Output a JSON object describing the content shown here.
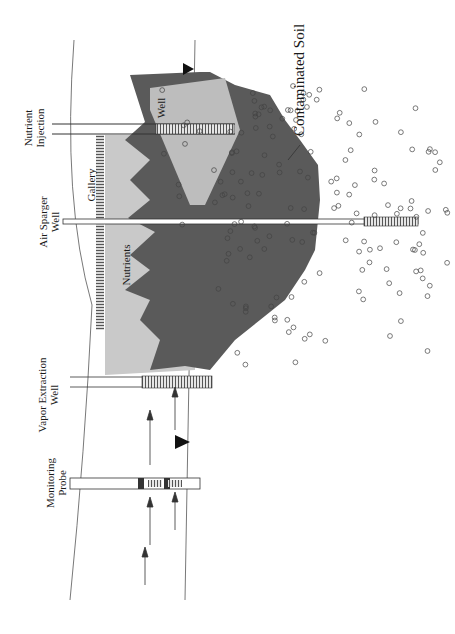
{
  "figure": {
    "orientation": "rotated 90 degrees clockwise",
    "labels": {
      "nutrient_injection": [
        "Nutrient",
        "Injection"
      ],
      "well_small": "Well",
      "gallery": "Gallery",
      "air_sparger": [
        "Air Sparger",
        "Well"
      ],
      "nutrients": "Nutrients",
      "vapor_extraction": [
        "Vapor Extraction",
        "Well"
      ],
      "monitoring_probe": [
        "Monitoring",
        "Probe"
      ],
      "contaminated_soil": "Contaminated Soil"
    },
    "colors": {
      "contaminated_zone": "#5a5a5a",
      "nutrient_zone": "#c8c8c8",
      "injection_plume": "#bdbdbd",
      "line": "#333333",
      "background": "#ffffff"
    }
  }
}
